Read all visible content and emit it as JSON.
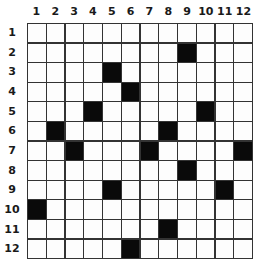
{
  "puzzle": {
    "columns": [
      "1",
      "2",
      "3",
      "4",
      "5",
      "6",
      "7",
      "8",
      "9",
      "10",
      "11",
      "12"
    ],
    "rows": [
      "1",
      "2",
      "3",
      "4",
      "5",
      "6",
      "7",
      "8",
      "9",
      "10",
      "11",
      "12"
    ],
    "size": 12,
    "filled_cells": [
      [
        2,
        9
      ],
      [
        3,
        5
      ],
      [
        4,
        6
      ],
      [
        5,
        4
      ],
      [
        5,
        10
      ],
      [
        6,
        2
      ],
      [
        6,
        8
      ],
      [
        7,
        3
      ],
      [
        7,
        7
      ],
      [
        7,
        12
      ],
      [
        8,
        9
      ],
      [
        9,
        5
      ],
      [
        9,
        11
      ],
      [
        10,
        1
      ],
      [
        11,
        8
      ],
      [
        12,
        6
      ]
    ],
    "colors": {
      "filled": "#0a0a0a",
      "empty": "#fdfdfd",
      "line": "#333333"
    }
  }
}
